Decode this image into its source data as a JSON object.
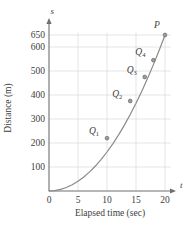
{
  "chart_data": {
    "type": "line",
    "title": "",
    "xlabel": "Elapsed time (sec)",
    "ylabel": "Distance (m)",
    "x_axis_variable": "t",
    "y_axis_variable": "s",
    "xlim": [
      0,
      21.5
    ],
    "ylim": [
      0,
      680
    ],
    "grid": true,
    "legend": "none",
    "x_ticks": [
      "0",
      "5",
      "10",
      "15",
      "20"
    ],
    "x_tick_values": [
      0,
      5,
      10,
      15,
      20
    ],
    "y_ticks": [
      "100",
      "200",
      "300",
      "400",
      "500",
      "600",
      "650"
    ],
    "y_tick_values": [
      100,
      200,
      300,
      400,
      500,
      600,
      650
    ],
    "curve_description": "s = 1.625 t squared",
    "curve_x": [
      0,
      1,
      2,
      3,
      4,
      5,
      6,
      7,
      8,
      9,
      10,
      11,
      12,
      13,
      14,
      15,
      16,
      17,
      18,
      19,
      20
    ],
    "curve_y": [
      0,
      1.6,
      6.5,
      14.6,
      26,
      40.6,
      58.5,
      79.6,
      104,
      131.6,
      162.5,
      196.6,
      234,
      274.6,
      318.5,
      365.6,
      416,
      469.6,
      526.5,
      586.6,
      650
    ],
    "points": [
      {
        "label": "Q",
        "subscript": "1",
        "x": 10,
        "y": 220,
        "label_dx": -13,
        "label_dy": -4
      },
      {
        "label": "Q",
        "subscript": "2",
        "x": 14,
        "y": 375,
        "label_dx": -13,
        "label_dy": -4
      },
      {
        "label": "Q",
        "subscript": "3",
        "x": 16.5,
        "y": 475,
        "label_dx": -13,
        "label_dy": -4
      },
      {
        "label": "Q",
        "subscript": "4",
        "x": 18,
        "y": 545,
        "label_dx": -13,
        "label_dy": -5
      },
      {
        "label": "P",
        "subscript": "",
        "x": 20,
        "y": 650,
        "label_dx": -8,
        "label_dy": -7
      }
    ],
    "colors": {
      "curve": "#8a8a8a",
      "grid": "#d5d5d5",
      "axis": "#6e6e6e",
      "point_fill": "#9a9a9a",
      "point_stroke": "#6f6f6f",
      "text": "#3d3d3d"
    }
  }
}
